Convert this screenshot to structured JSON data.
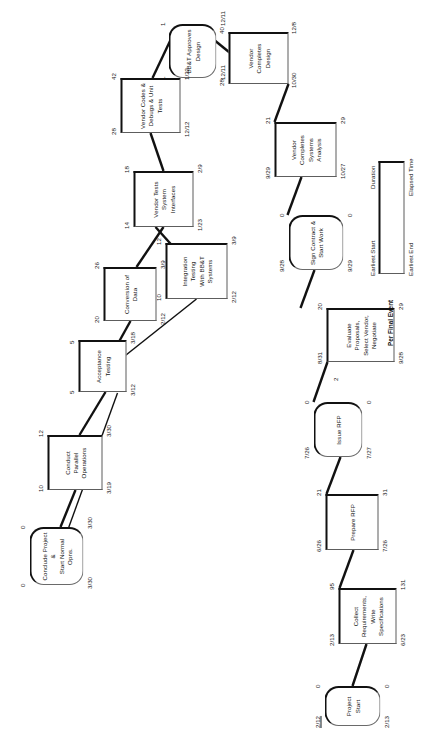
{
  "diagram": {
    "project_start_date_label": "2/12",
    "nodes": [
      {
        "id": "project-start",
        "label": "Project Start",
        "shape": "milestone",
        "duration": "0",
        "elapsed": "0",
        "earliest_start": "2/12",
        "earliest_end": "2/13"
      },
      {
        "id": "collect-requirements",
        "label": "Collect Requirements,\nWrite Specifications",
        "shape": "activity",
        "duration": "95",
        "elapsed": "131",
        "earliest_start": "2/13",
        "earliest_end": "6/23"
      },
      {
        "id": "prepare-rfp",
        "label": "Prepare RFP",
        "shape": "activity",
        "duration": "21",
        "elapsed": "31",
        "earliest_start": "6/26",
        "earliest_end": "7/26"
      },
      {
        "id": "issue-rfp",
        "label": "Issue RFP",
        "shape": "milestone",
        "duration": "0",
        "elapsed": "0",
        "earliest_start": "7/26",
        "earliest_end": "7/27"
      },
      {
        "id": "evaluate-proposals",
        "label": "Evaluate Proposals,\nSelect Vendor,\nNegotiate",
        "shape": "activity",
        "duration": "20",
        "elapsed": "29",
        "earliest_start": "8/31",
        "earliest_end": "9/28"
      },
      {
        "id": "sign-contract",
        "label": "Sign Contract &\nStart Work",
        "shape": "milestone",
        "duration": "0",
        "elapsed": "0",
        "earliest_start": "9/28",
        "earliest_end": "9/29"
      },
      {
        "id": "vendor-systems-analysis",
        "label": "Vendor Completes\nSystems Analysis",
        "shape": "activity",
        "duration": "21",
        "elapsed": "29",
        "earliest_start": "9/29",
        "earliest_end": "10/27"
      },
      {
        "id": "vendor-completes-design",
        "label": "Vendor Completes\nDesign",
        "shape": "activity",
        "duration": "28",
        "elapsed": "40",
        "earliest_start": "10/30",
        "earliest_end": "12/8"
      },
      {
        "id": "bbt-approves-design",
        "label": "BB&T Approves\nDesign",
        "shape": "milestone",
        "duration": "1",
        "elapsed": "1",
        "earliest_start": "12/11",
        "earliest_end": "12/11"
      },
      {
        "id": "vendor-codes",
        "label": "Vendor Codes &\nDebugs & Unit Tests",
        "shape": "activity",
        "duration": "28",
        "elapsed": "42",
        "earliest_start": "12/12",
        "earliest_end": "1/22"
      },
      {
        "id": "vendor-tests-interfaces",
        "label": "Vendor Tests System\nInterfaces",
        "shape": "activity",
        "duration": "14",
        "elapsed": "18",
        "earliest_start": "1/23",
        "earliest_end": "2/9"
      },
      {
        "id": "integration-testing",
        "label": "Integration Testing\nWith BB&T  Systems",
        "shape": "activity",
        "duration": "10",
        "elapsed": "12",
        "earliest_start": "2/12",
        "earliest_end": "3/9"
      },
      {
        "id": "conversion-of-data",
        "label": "Conversion of Data",
        "shape": "activity",
        "duration": "20",
        "elapsed": "26",
        "earliest_start": "2/12",
        "earliest_end": "3/9"
      },
      {
        "id": "acceptance-testing",
        "label": "Acceptance Testing",
        "shape": "activity",
        "duration": "5",
        "elapsed": "5",
        "earliest_start": "3/12",
        "earliest_end": "3/18"
      },
      {
        "id": "conduct-parallel-operations",
        "label": "Conduct Parallel\nOperations",
        "shape": "activity",
        "duration": "10",
        "elapsed": "12",
        "earliest_start": "3/19",
        "earliest_end": "3/30"
      },
      {
        "id": "conclude-project",
        "label": "Conclude Project &\nStart Normal Opns.",
        "shape": "milestone",
        "duration": "0",
        "elapsed": "0",
        "earliest_start": "3/30",
        "earliest_end": "3/30"
      }
    ],
    "edge_labels": [
      {
        "id": "edge-label-issue-to-evaluate",
        "text": "2"
      }
    ],
    "legend": {
      "title": "Per Final Event",
      "earliest_start": "Earliest  Start",
      "duration": "Duration",
      "earliest_end": "Earliest End",
      "elapsed_time": "Elapsed Time"
    }
  }
}
